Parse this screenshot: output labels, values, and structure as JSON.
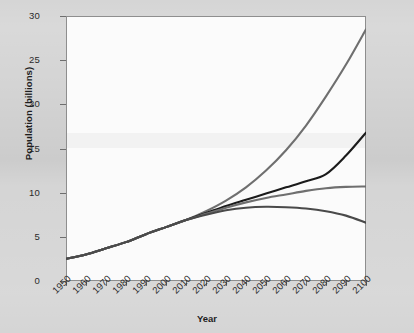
{
  "chart_data": {
    "type": "line",
    "title": "",
    "xlabel": "Year",
    "ylabel": "Population (billions)",
    "xlim": [
      1950,
      2100
    ],
    "ylim": [
      0,
      30
    ],
    "grid": false,
    "legend": "none",
    "x_ticks": [
      "1950",
      "1960",
      "1970",
      "1980",
      "1990",
      "2000",
      "2010",
      "2020",
      "2030",
      "2040",
      "2050",
      "2060",
      "2070",
      "2080",
      "2090",
      "2100"
    ],
    "y_ticks": [
      "0",
      "5",
      "10",
      "15",
      "20",
      "25",
      "30"
    ],
    "x": [
      1950,
      1960,
      1970,
      1980,
      1990,
      2000,
      2010,
      2020,
      2030,
      2040,
      2050,
      2060,
      2070,
      2080,
      2090,
      2100
    ],
    "series": [
      {
        "name": "high-variant",
        "color": "#6f6f6f",
        "style": "solid",
        "values": [
          2.5,
          3.0,
          3.7,
          4.4,
          5.3,
          6.1,
          6.9,
          7.9,
          9.1,
          10.6,
          12.5,
          14.8,
          17.6,
          20.9,
          24.5,
          28.5
        ]
      },
      {
        "name": "medium-variant",
        "color": "#1b1b1b",
        "style": "solid",
        "values": [
          2.5,
          3.0,
          3.7,
          4.4,
          5.3,
          6.1,
          6.9,
          7.7,
          8.5,
          9.2,
          9.9,
          10.6,
          11.3,
          12.1,
          14.2,
          16.8
        ]
      },
      {
        "name": "constant-fertility-variant",
        "color": "#6f6f6f",
        "style": "solid",
        "values": [
          2.5,
          3.0,
          3.7,
          4.4,
          5.3,
          6.1,
          6.9,
          7.6,
          8.3,
          8.9,
          9.4,
          9.8,
          10.2,
          10.5,
          10.65,
          10.7
        ]
      },
      {
        "name": "low-variant",
        "color": "#4a4a4a",
        "style": "solid",
        "values": [
          2.5,
          3.0,
          3.7,
          4.4,
          5.3,
          6.1,
          6.9,
          7.5,
          8.0,
          8.3,
          8.4,
          8.35,
          8.2,
          7.9,
          7.4,
          6.6
        ]
      }
    ]
  },
  "axes": {
    "y_title": "Population (billions)",
    "x_title": "Year"
  }
}
